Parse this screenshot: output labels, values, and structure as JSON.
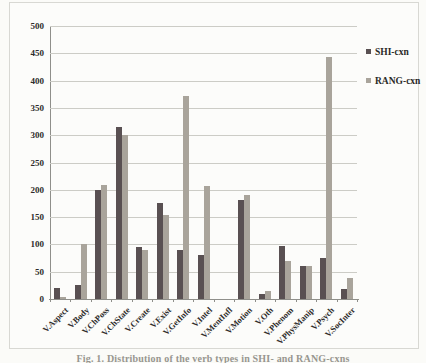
{
  "legend": {
    "series1_label": "SHI-cxn",
    "series2_label": "RANG-cxn"
  },
  "caption": "Fig. 1. Distribution of the verb types in SHI- and RANG-cxns",
  "colors": {
    "series1": "#595052",
    "series2": "#a9a49b",
    "gridline": "#ccccc6",
    "axis": "#8f8f8a"
  },
  "chart_data": {
    "type": "bar",
    "title": "",
    "xlabel": "",
    "ylabel": "",
    "categories": [
      "V.Aspect",
      "V.Body",
      "V.ChPoss",
      "V.ChState",
      "V.Create",
      "V.Exist",
      "V.GetInfo",
      "V.Intel",
      "V.MentInfl",
      "V.Motion",
      "V.Oth",
      "V.Phenom",
      "V.PhysManip",
      "V.Psych",
      "V.SocInter"
    ],
    "series": [
      {
        "name": "SHI-cxn",
        "color": "#595052",
        "values": [
          20,
          26,
          200,
          315,
          95,
          176,
          90,
          80,
          0,
          182,
          10,
          98,
          60,
          75,
          18
        ]
      },
      {
        "name": "RANG-cxn",
        "color": "#a9a49b",
        "values": [
          3,
          100,
          208,
          300,
          90,
          153,
          372,
          207,
          0,
          190,
          14,
          70,
          60,
          443,
          38
        ]
      }
    ],
    "ylim": [
      0,
      500
    ],
    "ytick_step": 50,
    "grid": true,
    "legend_position": "right",
    "x_labels_rotated_deg": -45
  }
}
